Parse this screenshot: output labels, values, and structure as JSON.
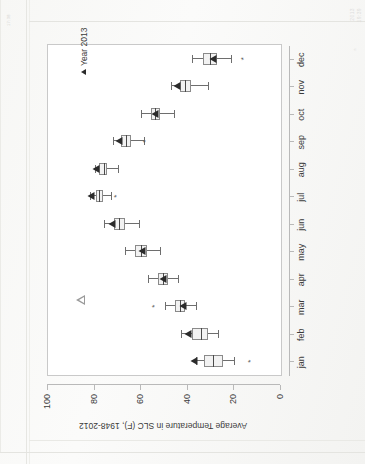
{
  "page": {
    "faint_notes": {
      "top_left": "17:38",
      "top_right_1": "2013",
      "top_right_2": "19:39",
      "top_right_3": "a"
    }
  },
  "legend": {
    "marker_icon": "triangle-marker",
    "label": "Year 2013"
  },
  "annotation": {
    "hollow_triangle_icon": "hollow-triangle-annotation"
  },
  "chart_data": {
    "type": "boxplot",
    "title": "",
    "xlabel": "",
    "ylabel": "Average Temperature in SLC (F), 1948-2012",
    "ylim": [
      0,
      100
    ],
    "yticks": [
      0,
      20,
      40,
      60,
      80,
      100
    ],
    "grid": false,
    "orientation": "rotated-90-ccw",
    "legend_position": "top-right-inside",
    "categories": [
      "jan",
      "feb",
      "mar",
      "apr",
      "may",
      "jun",
      "jul",
      "aug",
      "sep",
      "oct",
      "nov",
      "dec"
    ],
    "boxes": [
      {
        "category": "jan",
        "whisker_low": 20.0,
        "q1": 25.0,
        "median": 29.0,
        "q3": 33.0,
        "whisker_high": 36.5,
        "outliers": [
          13.0
        ],
        "marker_2013": 37.5
      },
      {
        "category": "feb",
        "whisker_low": 27.0,
        "q1": 31.5,
        "median": 34.5,
        "q3": 38.0,
        "whisker_high": 43.0,
        "outliers": [],
        "marker_2013": 40.0
      },
      {
        "category": "mar",
        "whisker_low": 36.5,
        "q1": 41.0,
        "median": 43.5,
        "q3": 45.5,
        "whisker_high": 50.0,
        "outliers": [
          54.0
        ],
        "marker_2013": 42.0
      },
      {
        "category": "apr",
        "whisker_low": 44.0,
        "q1": 48.5,
        "median": 50.5,
        "q3": 53.0,
        "whisker_high": 57.0,
        "outliers": [],
        "marker_2013": 50.5
      },
      {
        "category": "may",
        "whisker_low": 52.0,
        "q1": 57.5,
        "median": 60.0,
        "q3": 62.5,
        "whisker_high": 67.0,
        "outliers": [],
        "marker_2013": 59.5
      },
      {
        "category": "jun",
        "whisker_low": 61.0,
        "q1": 67.0,
        "median": 69.5,
        "q3": 71.5,
        "whisker_high": 76.0,
        "outliers": [],
        "marker_2013": 72.5
      },
      {
        "category": "jul",
        "whisker_low": 73.0,
        "q1": 76.5,
        "median": 78.0,
        "q3": 79.5,
        "whisker_high": 82.0,
        "outliers": [
          70.5
        ],
        "marker_2013": 81.5
      },
      {
        "category": "aug",
        "whisker_low": 70.0,
        "q1": 74.5,
        "median": 76.0,
        "q3": 78.0,
        "whisker_high": 80.0,
        "outliers": [],
        "marker_2013": 79.5
      },
      {
        "category": "sep",
        "whisker_low": 59.0,
        "q1": 64.5,
        "median": 66.5,
        "q3": 68.5,
        "whisker_high": 72.0,
        "outliers": [
          58.0
        ],
        "marker_2013": 69.5
      },
      {
        "category": "oct",
        "whisker_low": 46.0,
        "q1": 52.0,
        "median": 54.0,
        "q3": 56.0,
        "whisker_high": 60.0,
        "outliers": [],
        "marker_2013": 54.0
      },
      {
        "category": "nov",
        "whisker_low": 31.5,
        "q1": 38.5,
        "median": 41.0,
        "q3": 43.5,
        "whisker_high": 47.0,
        "outliers": [],
        "marker_2013": 44.5
      },
      {
        "category": "dec",
        "whisker_low": 21.5,
        "q1": 27.5,
        "median": 30.5,
        "q3": 33.5,
        "whisker_high": 38.0,
        "outliers": [
          16.0
        ],
        "marker_2013": 29.0
      }
    ]
  }
}
